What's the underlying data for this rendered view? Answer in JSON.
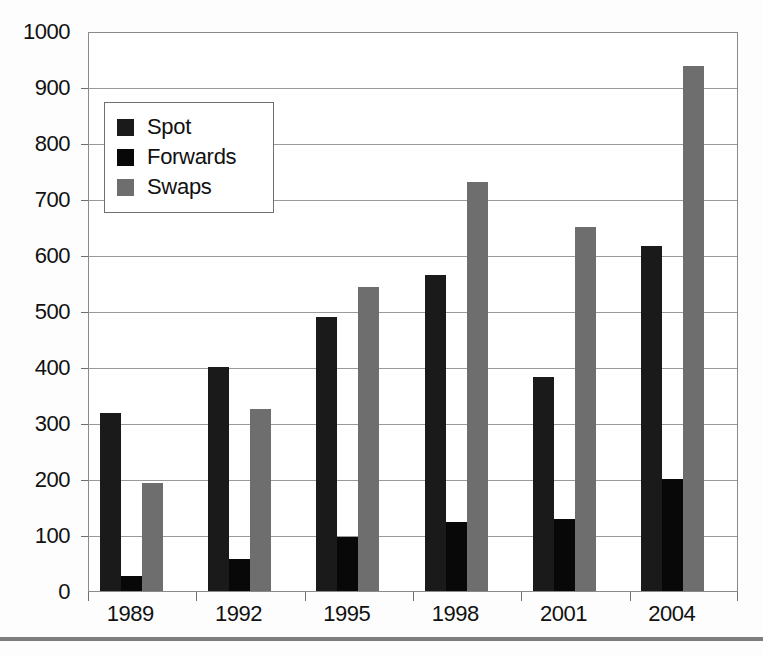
{
  "chart_data": {
    "type": "bar",
    "title": "",
    "subtitle": "",
    "xlabel": "",
    "ylabel": "",
    "categories": [
      "1989",
      "1992",
      "1995",
      "1998",
      "2001",
      "2004"
    ],
    "series": [
      {
        "name": "Spot",
        "color": "#1a1a1a",
        "values": [
          317,
          400,
          490,
          565,
          383,
          616
        ]
      },
      {
        "name": "Forwards",
        "color": "#080808",
        "values": [
          27,
          57,
          96,
          123,
          128,
          200
        ]
      },
      {
        "name": "Swaps",
        "color": "#6e6e6e",
        "values": [
          193,
          325,
          543,
          731,
          650,
          938
        ]
      }
    ],
    "ylim": [
      0,
      1000
    ],
    "ytick_values": [
      0,
      100,
      200,
      300,
      400,
      500,
      600,
      700,
      800,
      900,
      1000
    ],
    "ytick_labels": [
      "0",
      "100",
      "200",
      "300",
      "400",
      "500",
      "600",
      "700",
      "800",
      "900",
      "1000"
    ],
    "grid": true,
    "grid_axis": "y",
    "legend_position": "upper-left",
    "legend_entries": [
      "Spot",
      "Forwards",
      "Swaps"
    ],
    "annotations": []
  },
  "legend": {
    "entries": [
      {
        "label": "Spot",
        "swatch": "#1a1a1a"
      },
      {
        "label": "Forwards",
        "swatch": "#080808"
      },
      {
        "label": "Swaps",
        "swatch": "#6e6e6e"
      }
    ]
  },
  "colors": {
    "spot": "#1a1a1a",
    "forwards": "#080808",
    "swaps": "#6e6e6e",
    "gridline": "#9a9a9a",
    "axis": "#6f6f6f",
    "text": "#111111",
    "background": "#ffffff",
    "footer_rule": "#7d7d7d"
  }
}
